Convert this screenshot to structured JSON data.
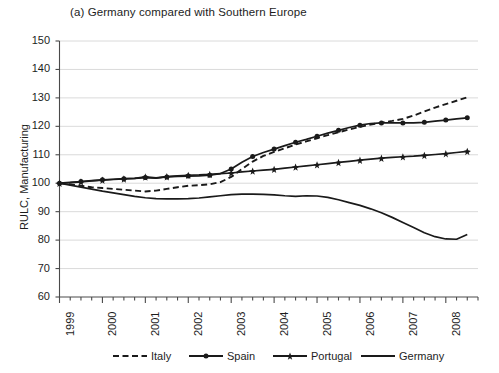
{
  "chart_data": {
    "type": "line",
    "title": "(a) Germany compared with Southern Europe",
    "xlabel": "",
    "ylabel": "RULC, Manufacturing",
    "ylim": [
      60,
      150
    ],
    "ytick_values": [
      60,
      70,
      80,
      90,
      100,
      110,
      120,
      130,
      140,
      150
    ],
    "ytick_labels": [
      "60",
      "70",
      "80",
      "90",
      "100",
      "110",
      "120",
      "130",
      "140",
      "150"
    ],
    "xlim": [
      1999.0,
      2008.75
    ],
    "xtick_labels": [
      "1999",
      "2000",
      "2001",
      "2002",
      "2003",
      "2004",
      "2005",
      "2006",
      "2007",
      "2008"
    ],
    "xtick_values": [
      1999,
      2000,
      2001,
      2002,
      2003,
      2004,
      2005,
      2006,
      2007,
      2008
    ],
    "minor_tick_interval": 0.25,
    "grid": "horizontal",
    "legend_position": "bottom",
    "x": [
      1999.0,
      1999.25,
      1999.5,
      1999.75,
      2000.0,
      2000.25,
      2000.5,
      2000.75,
      2001.0,
      2001.25,
      2001.5,
      2001.75,
      2002.0,
      2002.25,
      2002.5,
      2002.75,
      2003.0,
      2003.25,
      2003.5,
      2003.75,
      2004.0,
      2004.25,
      2004.5,
      2004.75,
      2005.0,
      2005.25,
      2005.5,
      2005.75,
      2006.0,
      2006.25,
      2006.5,
      2006.75,
      2007.0,
      2007.25,
      2007.5,
      2007.75,
      2008.0,
      2008.25,
      2008.5
    ],
    "series": [
      {
        "name": "Italy",
        "style": "dashed",
        "marker": "none",
        "color": "#1a1a1a",
        "values": [
          100.0,
          99.6,
          99.1,
          98.6,
          98.3,
          98.0,
          97.7,
          97.4,
          97.1,
          97.4,
          98.0,
          98.6,
          99.1,
          99.3,
          99.6,
          100.4,
          102.2,
          105.0,
          107.6,
          109.6,
          111.0,
          112.3,
          113.6,
          114.7,
          115.8,
          116.9,
          117.9,
          118.9,
          119.8,
          120.6,
          121.3,
          121.9,
          122.6,
          123.8,
          125.2,
          126.6,
          127.8,
          129.0,
          130.2
        ]
      },
      {
        "name": "Spain",
        "style": "solid",
        "marker": "circle",
        "color": "#1a1a1a",
        "values": [
          100.0,
          100.3,
          100.6,
          100.9,
          101.2,
          101.4,
          101.6,
          101.7,
          102.0,
          101.8,
          102.2,
          102.4,
          102.5,
          102.6,
          102.8,
          103.4,
          105.0,
          107.4,
          109.4,
          110.8,
          112.0,
          113.2,
          114.4,
          115.4,
          116.5,
          117.6,
          118.6,
          119.6,
          120.4,
          121.0,
          121.2,
          121.2,
          121.2,
          121.2,
          121.4,
          121.8,
          122.2,
          122.6,
          123.0
        ]
      },
      {
        "name": "Portugal",
        "style": "solid",
        "marker": "star",
        "color": "#1a1a1a",
        "values": [
          100.0,
          100.2,
          100.5,
          100.8,
          101.1,
          101.3,
          101.5,
          101.7,
          102.2,
          101.9,
          102.3,
          102.6,
          102.8,
          102.9,
          103.1,
          103.4,
          103.6,
          104.0,
          104.3,
          104.6,
          104.9,
          105.3,
          105.7,
          106.1,
          106.5,
          106.9,
          107.3,
          107.7,
          108.1,
          108.5,
          108.8,
          109.1,
          109.3,
          109.5,
          109.8,
          110.1,
          110.4,
          110.8,
          111.2
        ]
      },
      {
        "name": "Germany",
        "style": "solid",
        "marker": "none",
        "color": "#1a1a1a",
        "values": [
          100.0,
          99.3,
          98.6,
          97.9,
          97.2,
          96.6,
          96.0,
          95.4,
          94.9,
          94.6,
          94.5,
          94.5,
          94.6,
          94.8,
          95.2,
          95.6,
          96.0,
          96.2,
          96.2,
          96.1,
          95.9,
          95.6,
          95.4,
          95.6,
          95.5,
          95.0,
          94.2,
          93.2,
          92.2,
          91.0,
          89.6,
          88.0,
          86.2,
          84.4,
          82.6,
          81.2,
          80.4,
          80.3,
          82.0
        ]
      }
    ]
  }
}
